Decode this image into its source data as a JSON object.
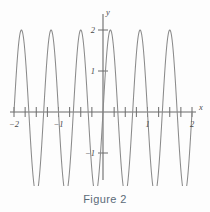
{
  "caption": {
    "text": "Figure 2"
  },
  "chart_data": {
    "type": "line",
    "title": "",
    "subtitle": "",
    "xlabel": "x",
    "ylabel": "y",
    "xlim": [
      -2.15,
      2.15
    ],
    "ylim": [
      -2.35,
      2.35
    ],
    "grid": false,
    "legend": null,
    "legend_position": "none",
    "x_ticks": [
      -2,
      -1,
      1,
      2
    ],
    "x_tick_labels": [
      "−2",
      "−1",
      "1",
      "2"
    ],
    "y_ticks": [
      -2,
      -1,
      1,
      2
    ],
    "y_tick_labels": [
      "−2",
      "−1",
      "1",
      "2"
    ],
    "minor_x_ticks": [
      -1.75,
      -1.5,
      -1.25,
      -0.75,
      -0.5,
      -0.25,
      0.25,
      0.5,
      0.75,
      1.25,
      1.5,
      1.75
    ],
    "series": [
      {
        "name": "y = 2 sin(3πx⁄2)",
        "amplitude": 2,
        "period": 0.6667,
        "cycles_shown": 6,
        "peak_x": [
          -1.8333,
          -1.1667,
          -0.5,
          0.1667,
          0.8333,
          1.5
        ],
        "peak_y": [
          2,
          2,
          2,
          2,
          2,
          2
        ],
        "trough_x": [
          -1.5,
          -0.8333,
          -0.1667,
          0.5,
          1.1667,
          1.8333
        ],
        "trough_y": [
          -2,
          -2,
          -2,
          -2,
          -2,
          -2
        ],
        "zero_crossings": [
          -2,
          -1.6667,
          -1.3333,
          -1,
          -0.6667,
          -0.3333,
          0,
          0.3333,
          0.6667,
          1,
          1.3333,
          1.6667,
          2
        ]
      }
    ],
    "colors": {
      "curve": "#8a8a8a",
      "axis": "#6b6b6b",
      "caption": "#5b6a78",
      "background": "#fdfdfd"
    }
  },
  "axis_labels": {
    "x_axis_name": "x",
    "y_axis_name": "y"
  }
}
